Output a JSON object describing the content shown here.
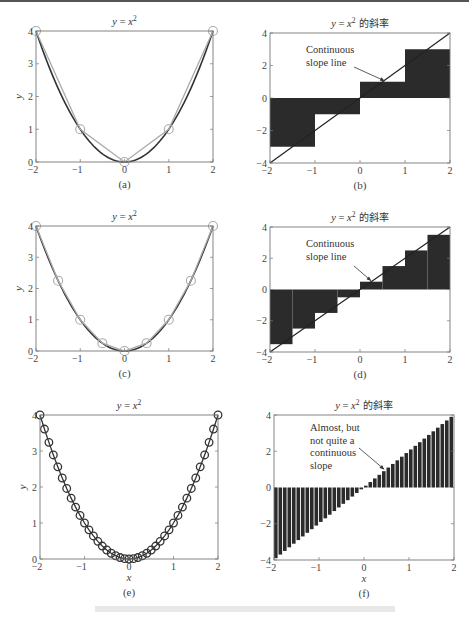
{
  "figure": {
    "caption_faint": ""
  },
  "panels": [
    {
      "id": "a",
      "title_y": "y",
      "title_eq": " = x",
      "title_sup": "2",
      "title_cn": "",
      "label": "(a)",
      "ylabel": "y",
      "xlabel": "",
      "box": [
        36,
        31,
        213,
        162
      ]
    },
    {
      "id": "b",
      "title_y": "y",
      "title_eq": " = x",
      "title_sup": "2",
      "title_cn": " 的斜率",
      "label": "(b)",
      "ylabel": "",
      "xlabel": "",
      "box": [
        270,
        33,
        450,
        163
      ],
      "annotation": [
        "Continuous",
        "slope line"
      ]
    },
    {
      "id": "c",
      "title_y": "y",
      "title_eq": " = x",
      "title_sup": "2",
      "title_cn": "",
      "label": "(c)",
      "ylabel": "y",
      "xlabel": "",
      "box": [
        36,
        226,
        213,
        351
      ]
    },
    {
      "id": "d",
      "title_y": "y",
      "title_eq": " = x",
      "title_sup": "2",
      "title_cn": " 的斜率",
      "label": "(d)",
      "ylabel": "",
      "xlabel": "",
      "box": [
        270,
        227,
        450,
        352
      ],
      "annotation": [
        "Continuous",
        "slope line"
      ]
    },
    {
      "id": "e",
      "title_y": "y",
      "title_eq": " = x",
      "title_sup": "2",
      "title_cn": "",
      "label": "(e)",
      "ylabel": "y",
      "xlabel": "x",
      "box": [
        40,
        415,
        218,
        559
      ]
    },
    {
      "id": "f",
      "title_y": "y",
      "title_eq": " = x",
      "title_sup": "2",
      "title_cn": " 的斜率",
      "label": "(f)",
      "ylabel": "",
      "xlabel": "x",
      "box": [
        274,
        415,
        454,
        560
      ],
      "annotation": [
        "Almost, but",
        "not quite a",
        "continuous",
        "slope"
      ]
    }
  ],
  "chart_data": [
    {
      "panel": "a",
      "type": "line",
      "title": "y = x^2",
      "xlabel": "",
      "ylabel": "y",
      "xlim": [
        -2,
        2
      ],
      "ylim": [
        0,
        4
      ],
      "xticks": [
        -2,
        -1,
        0,
        1,
        2
      ],
      "yticks": [
        0,
        1,
        2,
        3,
        4
      ],
      "series": [
        {
          "name": "y = x^2 (continuous)",
          "color": "#333333",
          "function": "x^2"
        },
        {
          "name": "sampled, dx = 1",
          "color": "#aaaaaa",
          "marker": "circle",
          "x": [
            -2,
            -1,
            0,
            1,
            2
          ],
          "y": [
            4,
            1,
            0,
            1,
            4
          ]
        }
      ]
    },
    {
      "panel": "b",
      "type": "bar",
      "title": "y = x^2 的斜率",
      "xlim": [
        -2,
        2
      ],
      "ylim": [
        -4,
        4
      ],
      "xticks": [
        -2,
        -1,
        0,
        1,
        2
      ],
      "yticks": [
        -4,
        -2,
        0,
        2,
        4
      ],
      "bar_left_edges": [
        -2,
        -1,
        0,
        1
      ],
      "bar_width": 1,
      "values": [
        -3,
        -1,
        1,
        3
      ],
      "line": {
        "name": "Continuous slope line",
        "x": [
          -2,
          2
        ],
        "y": [
          -4,
          4
        ]
      },
      "annotation": "Continuous slope line"
    },
    {
      "panel": "c",
      "type": "line",
      "title": "y = x^2",
      "xlabel": "",
      "ylabel": "y",
      "xlim": [
        -2,
        2
      ],
      "ylim": [
        0,
        4
      ],
      "xticks": [
        -2,
        -1,
        0,
        1,
        2
      ],
      "yticks": [
        0,
        1,
        2,
        3,
        4
      ],
      "series": [
        {
          "name": "y = x^2 (continuous)",
          "color": "#333333",
          "function": "x^2"
        },
        {
          "name": "sampled, dx = 0.5",
          "color": "#aaaaaa",
          "marker": "circle",
          "x": [
            -2,
            -1.5,
            -1,
            -0.5,
            0,
            0.5,
            1,
            1.5,
            2
          ],
          "y": [
            4,
            2.25,
            1,
            0.25,
            0,
            0.25,
            1,
            2.25,
            4
          ]
        }
      ]
    },
    {
      "panel": "d",
      "type": "bar",
      "title": "y = x^2 的斜率",
      "xlim": [
        -2,
        2
      ],
      "ylim": [
        -4,
        4
      ],
      "xticks": [
        -2,
        -1,
        0,
        1,
        2
      ],
      "yticks": [
        -4,
        -2,
        0,
        2,
        4
      ],
      "bar_left_edges": [
        -2,
        -1.5,
        -1,
        -0.5,
        0,
        0.5,
        1,
        1.5
      ],
      "bar_width": 0.5,
      "values": [
        -3.5,
        -2.5,
        -1.5,
        -0.5,
        0.5,
        1.5,
        2.5,
        3.5
      ],
      "line": {
        "name": "Continuous slope line",
        "x": [
          -2,
          2
        ],
        "y": [
          -4,
          4
        ]
      },
      "annotation": "Continuous slope line"
    },
    {
      "panel": "e",
      "type": "line",
      "title": "y = x^2",
      "xlabel": "x",
      "ylabel": "y",
      "xlim": [
        -2,
        2
      ],
      "ylim": [
        0,
        4
      ],
      "xticks": [
        -2,
        -1,
        0,
        1,
        2
      ],
      "yticks": [
        0,
        1,
        2,
        3,
        4
      ],
      "series": [
        {
          "name": "sampled, dx = 0.1",
          "color": "#333333",
          "marker": "circle",
          "x_start": -2,
          "x_end": 2,
          "dx": 0.1,
          "function": "x^2"
        }
      ]
    },
    {
      "panel": "f",
      "type": "bar",
      "title": "y = x^2 的斜率",
      "xlabel": "x",
      "xlim": [
        -2,
        2
      ],
      "ylim": [
        -4,
        4
      ],
      "xticks": [
        -2,
        -1,
        0,
        1,
        2
      ],
      "yticks": [
        -4,
        -2,
        0,
        2,
        4
      ],
      "bar_left_start": -2,
      "bar_width": 0.1,
      "bar_count": 40,
      "values_rule": "2*x_left + 0.1",
      "values": [
        -3.9,
        -3.7,
        -3.5,
        -3.3,
        -3.1,
        -2.9,
        -2.7,
        -2.5,
        -2.3,
        -2.1,
        -1.9,
        -1.7,
        -1.5,
        -1.3,
        -1.1,
        -0.9,
        -0.7,
        -0.5,
        -0.3,
        -0.1,
        0.1,
        0.3,
        0.5,
        0.7,
        0.9,
        1.1,
        1.3,
        1.5,
        1.7,
        1.9,
        2.1,
        2.3,
        2.5,
        2.7,
        2.9,
        3.1,
        3.3,
        3.5,
        3.7,
        3.9
      ],
      "annotation": "Almost, but not quite a continuous slope"
    }
  ]
}
